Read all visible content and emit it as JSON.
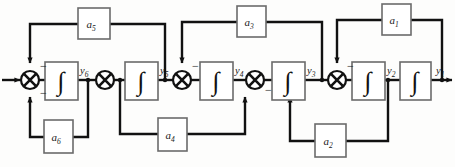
{
  "diagram": {
    "colors": {
      "line": "#111111",
      "block_stroke": "#6b6b6b",
      "block_fill": "#ffffff",
      "background": "#fdfdfc",
      "text": "#1a1a1a"
    },
    "gain_blocks": [
      {
        "id": "a5",
        "label": "a",
        "sub": "5"
      },
      {
        "id": "a3",
        "label": "a",
        "sub": "3"
      },
      {
        "id": "a1",
        "label": "a",
        "sub": "1"
      },
      {
        "id": "a6",
        "label": "a",
        "sub": "6"
      },
      {
        "id": "a4",
        "label": "a",
        "sub": "4"
      },
      {
        "id": "a2",
        "label": "a",
        "sub": "2"
      }
    ],
    "integrators": [
      {
        "id": "int6",
        "glyph": "∫"
      },
      {
        "id": "int5",
        "glyph": "∫"
      },
      {
        "id": "int4",
        "glyph": "∫"
      },
      {
        "id": "int3",
        "glyph": "∫"
      },
      {
        "id": "int2",
        "glyph": "∫"
      },
      {
        "id": "int1",
        "glyph": "∫"
      }
    ],
    "signals": [
      {
        "id": "y6",
        "label": "y",
        "sub": "6"
      },
      {
        "id": "y5",
        "label": "y",
        "sub": "5"
      },
      {
        "id": "y4",
        "label": "y",
        "sub": "4"
      },
      {
        "id": "y3",
        "label": "y",
        "sub": "3"
      },
      {
        "id": "y2",
        "label": "y",
        "sub": "2"
      },
      {
        "id": "y1",
        "label": "y",
        "sub": "1"
      }
    ],
    "summing_junctions": [
      {
        "id": "sum6",
        "signs": [
          "−",
          "−"
        ]
      },
      {
        "id": "sum5",
        "signs": [
          "−"
        ]
      },
      {
        "id": "sum4",
        "signs": [
          "−"
        ]
      },
      {
        "id": "sum3",
        "signs": [
          "−"
        ]
      }
    ],
    "signs": {
      "minus": "−"
    }
  }
}
